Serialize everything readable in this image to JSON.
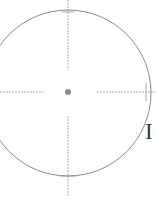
{
  "figure": {
    "background_color": "#ffffff",
    "width": 157,
    "height": 207
  },
  "circle": {
    "name": "primary-circle",
    "center_x": 68,
    "center_y": 93,
    "radius": 83,
    "stroke_color": "#8a8a8a",
    "stroke_width": 1,
    "fill": "none"
  },
  "center_marker": {
    "name": "center-point",
    "x": 68,
    "y": 92,
    "radius": 3,
    "color": "#8c8c8c"
  },
  "crosshair": {
    "stroke_color": "#b0b0b0",
    "stroke_width": 1,
    "tick_color": "#a8a8a8",
    "horizontal": {
      "left_segment": {
        "x1": 0,
        "x2": 45,
        "y": 92
      },
      "right_segment": {
        "x1": 97,
        "x2": 157,
        "y": 92
      }
    },
    "vertical": {
      "top_segment": {
        "y1": 0,
        "y2": 70,
        "x": 68
      },
      "bottom_segment": {
        "y1": 116,
        "y2": 196,
        "x": 68
      }
    },
    "ticks": [
      {
        "name": "tick-top-circle-edge",
        "x": 68,
        "y": 12,
        "orientation": "horizontal",
        "length": 13
      },
      {
        "name": "tick-bottom-circle-edge",
        "x": 68,
        "y": 176,
        "orientation": "horizontal",
        "length": 17
      },
      {
        "name": "tick-right-circle-edge",
        "x": 146,
        "y": 92,
        "orientation": "vertical",
        "length": 18
      }
    ],
    "dash_pattern": "2 1"
  },
  "labels": [
    {
      "name": "right-edge-label",
      "text": "I",
      "x": 145,
      "y": 120,
      "font_size": 23,
      "color": "#3a3a3a"
    }
  ]
}
